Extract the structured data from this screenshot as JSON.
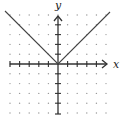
{
  "chart_data": {
    "type": "line",
    "title": "",
    "xlabel": "x",
    "ylabel": "y",
    "function": "y = |x|",
    "xlim": [
      -5,
      5
    ],
    "ylim": [
      -5,
      5
    ],
    "grid": "dots",
    "series": [
      {
        "name": "y=|x|",
        "x": [
          -5,
          0,
          5
        ],
        "y": [
          5,
          0,
          5
        ],
        "color": "#333333"
      }
    ]
  },
  "labels": {
    "x_axis": "x",
    "y_axis": "y"
  }
}
